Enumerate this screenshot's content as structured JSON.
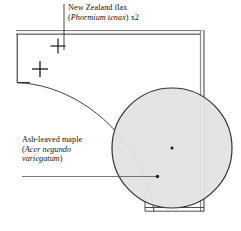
{
  "diagram": {
    "type": "garden-planting-plan",
    "background_color": "#ffffff",
    "line_color": "#1a1a1a",
    "wall_fill_color": "#f2f2f2",
    "shrub_fill_color": "#e2e2e2",
    "shrub_stroke_color": "#333333"
  },
  "labels": {
    "flax": {
      "common_name": "New Zealand flax",
      "botanical_open": "(",
      "botanical_name": "Phormium tenax",
      "botanical_close": ")",
      "quantity": "x2"
    },
    "maple": {
      "common_name": "Ash-leaved maple",
      "botanical_open": "(",
      "botanical_name_line1": "Acer negundo",
      "botanical_name_line2": "variegatum",
      "botanical_close": ")"
    }
  },
  "plants": [
    {
      "id": "flax-1",
      "name": "New Zealand flax",
      "botanical": "Phormium tenax",
      "symbol": "cross",
      "x": 58,
      "y": 46
    },
    {
      "id": "flax-2",
      "name": "New Zealand flax",
      "botanical": "Phormium tenax",
      "symbol": "cross",
      "x": 40,
      "y": 69
    },
    {
      "id": "maple-1",
      "name": "Ash-leaved maple",
      "botanical": "Acer negundo variegatum",
      "symbol": "filled-circle",
      "x": 172,
      "y": 148,
      "radius": 60
    }
  ],
  "leaders": [
    {
      "id": "flax-leader",
      "from_x": 64,
      "from_y": 3,
      "to_x": 64,
      "to_y": 50,
      "orientation": "vertical",
      "target": "flax-1"
    },
    {
      "id": "maple-leader",
      "from_x": 22,
      "from_y": 176,
      "to_x": 158,
      "to_y": 176,
      "orientation": "horizontal",
      "target": "maple-1"
    }
  ],
  "structures": {
    "top_wall": "double-line",
    "right_wall": "double-line",
    "bottom_wall": "double-line",
    "bed_edge": "curved"
  }
}
